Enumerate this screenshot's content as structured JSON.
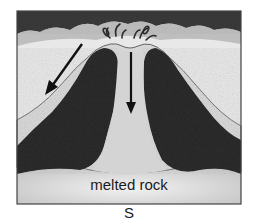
{
  "diagram": {
    "labels": {
      "chamber": "melted rock",
      "caption": "S"
    },
    "elements": {
      "arrows": [
        {
          "name": "left-slope-arrow",
          "direction": "down-left"
        },
        {
          "name": "central-vent-arrow",
          "direction": "down"
        }
      ]
    },
    "colors": {
      "rock_dark": "#2b2b2b",
      "cone_light": "#d9d9d9",
      "ground_light": "#e6e6e6",
      "magma": "#cfcfcf",
      "outline": "#333333"
    }
  }
}
